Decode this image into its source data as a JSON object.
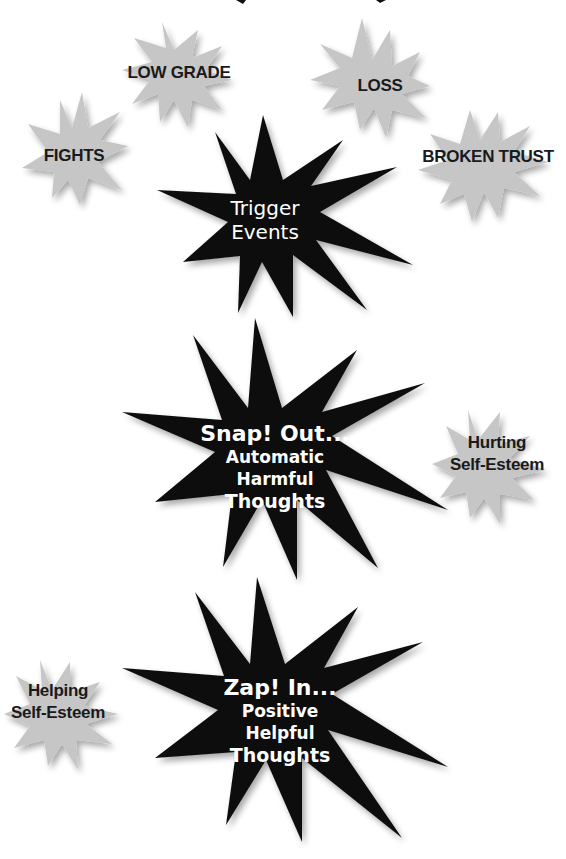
{
  "colors": {
    "background": "#ffffff",
    "trigger_star": "#c6c6c6",
    "trigger_star_shade": "#a8a8a8",
    "main_star": "#111111",
    "main_text": "#ffffff",
    "trigger_text": "#1a1a1a"
  },
  "triggers": {
    "fights": "FIGHTS",
    "low_grade": "LOW GRADE",
    "loss": "LOSS",
    "broken_trust": "BROKEN TRUST"
  },
  "trigger_events": {
    "line1": "Trigger",
    "line2": "Events"
  },
  "snap_out": {
    "title": "Snap! Out...",
    "line1": "Automatic",
    "line2": "Harmful",
    "line3": "Thoughts"
  },
  "hurting": {
    "line1": "Hurting",
    "line2": "Self-Esteem"
  },
  "zap_in": {
    "title": "Zap! In...",
    "line1": "Positive",
    "line2": "Helpful",
    "line3": "Thoughts"
  },
  "helping": {
    "line1": "Helping",
    "line2": "Self-Esteem"
  }
}
